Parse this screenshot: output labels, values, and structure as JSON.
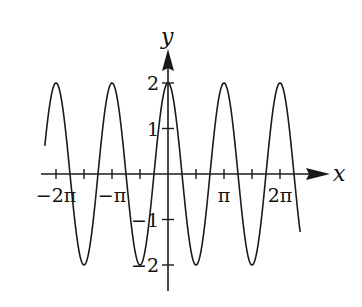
{
  "chart_data": {
    "type": "line",
    "title": "",
    "xlabel": "x",
    "ylabel": "y",
    "function": "y = 2cos(2x)",
    "series": [
      {
        "name": "curve",
        "amplitude": 2,
        "angular_frequency": 2,
        "phase": 0,
        "x_start_pi": -2.2,
        "x_end_pi": 2.36,
        "peaks_x_pi": [
          -2,
          -1,
          0,
          1,
          2
        ],
        "troughs_x_pi": [
          -1.5,
          -0.5,
          0.5,
          1.5
        ],
        "zeros_x_pi": [
          -1.75,
          -1.25,
          -0.75,
          -0.25,
          0.25,
          0.75,
          1.25,
          1.75,
          2.25
        ]
      }
    ],
    "x_ticks_pi": [
      -2,
      -1.5,
      -1,
      -0.5,
      0.5,
      1,
      1.5,
      2
    ],
    "x_tick_labels": [
      {
        "value_pi": -2,
        "label": "−2π"
      },
      {
        "value_pi": -1,
        "label": "−π"
      },
      {
        "value_pi": 1,
        "label": "π"
      },
      {
        "value_pi": 2,
        "label": "2π"
      }
    ],
    "y_ticks": [
      -2,
      -1,
      1,
      2
    ],
    "y_tick_labels": [
      {
        "value": 2,
        "label": "2"
      },
      {
        "value": 1,
        "label": "1"
      },
      {
        "value": -1,
        "label": "−1"
      },
      {
        "value": -2,
        "label": "−2"
      }
    ],
    "xlim_pi": [
      -2.25,
      2.9
    ],
    "ylim": [
      -2.5,
      2.7
    ],
    "grid": false,
    "legend": null
  },
  "colors": {
    "stroke": "#1a1a1a",
    "background": "#ffffff"
  }
}
